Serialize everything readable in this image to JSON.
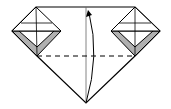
{
  "diagram": {
    "type": "origami-fold-step",
    "colors": {
      "line": "#000000",
      "paper": "#ffffff",
      "shade": "#b0b0b0"
    },
    "fold_line": "dashed",
    "arrow": "curved-up"
  }
}
